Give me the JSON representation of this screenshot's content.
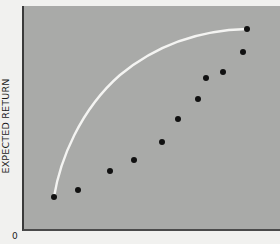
{
  "chart_data": {
    "type": "scatter",
    "title": "",
    "xlabel": "",
    "ylabel": "EXPECTED RETURN",
    "origin_label": "0",
    "grid": false,
    "legend": null,
    "xlim": [
      0,
      100
    ],
    "ylim": [
      0,
      100
    ],
    "series": [
      {
        "name": "points",
        "kind": "scatter",
        "color": "#111111",
        "x": [
          12.5,
          21.8,
          34.2,
          43.6,
          54.5,
          60.7,
          68.5,
          71.6,
          78.2,
          86.0,
          87.2
        ],
        "y": [
          15.1,
          18.2,
          26.7,
          31.6,
          39.6,
          49.8,
          58.7,
          68.0,
          70.7,
          79.6,
          89.8
        ]
      },
      {
        "name": "frontier",
        "kind": "curve",
        "color": "#f4f4f2",
        "x": [
          12.5,
          17.5,
          30.4,
          49.8,
          69.3,
          86.8
        ],
        "y": [
          15.1,
          36.0,
          62.7,
          78.2,
          86.7,
          89.8
        ]
      }
    ]
  },
  "pixels": {
    "points": [
      [
        54,
        197
      ],
      [
        78,
        190
      ],
      [
        110,
        171
      ],
      [
        134,
        160
      ],
      [
        162,
        142
      ],
      [
        178,
        119
      ],
      [
        198,
        99
      ],
      [
        206,
        78
      ],
      [
        223,
        72
      ],
      [
        243,
        52
      ],
      [
        247,
        29
      ]
    ],
    "curve_path": "M54,197 C60,160 80,110 120,75 C160,42 205,30 247,29"
  }
}
